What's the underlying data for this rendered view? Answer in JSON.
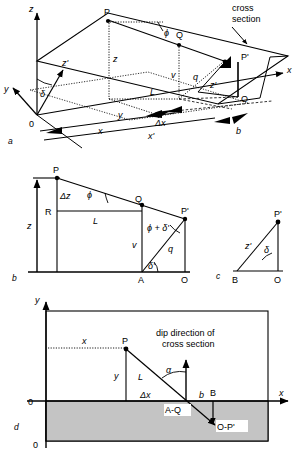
{
  "figure": {
    "panels": [
      {
        "id": "a",
        "label": "a",
        "name": "panel-a-3d-block"
      },
      {
        "id": "b",
        "label": "b",
        "name": "panel-b-vertical-section"
      },
      {
        "id": "c",
        "label": "c",
        "name": "panel-c-small-triangle"
      },
      {
        "id": "d",
        "label": "d",
        "name": "panel-d-map-view"
      }
    ]
  },
  "panel_a": {
    "annotation": "cross\nsection",
    "annotation_line1": "cross",
    "annotation_line2": "section",
    "axes": {
      "x": "x",
      "y": "y",
      "z": "z",
      "z_prime": "z'"
    },
    "points": {
      "origin": "0",
      "P": "P",
      "Q": "Q",
      "P_prime": "P'",
      "O": "O"
    },
    "lengths": {
      "z": "z",
      "v": "v",
      "q": "q",
      "L": "L",
      "z_prime": "z'",
      "y": "y",
      "x": "x",
      "x_prime": "x'",
      "delta_x": "Δx",
      "b": "b"
    },
    "angles": {
      "phi": "ϕ",
      "delta": "δ"
    }
  },
  "panel_b": {
    "points": {
      "P": "P",
      "R": "R",
      "Q": "Q",
      "P_prime": "P'",
      "A": "A",
      "O": "O"
    },
    "lengths": {
      "z": "z",
      "delta_z": "Δz",
      "L": "L",
      "v": "v",
      "q": "q"
    },
    "angles": {
      "phi": "ϕ",
      "phi_plus_delta_prime": "ϕ + δ'",
      "delta_prime": "δ'"
    }
  },
  "panel_c": {
    "points": {
      "P_prime": "P'",
      "B": "B",
      "O": "O"
    },
    "lengths": {
      "z_prime": "z'"
    },
    "angles": {
      "delta": "δ"
    }
  },
  "panel_d": {
    "axes": {
      "x": "x",
      "y": "y"
    },
    "origin_labels": {
      "top": "0",
      "bottom": "0"
    },
    "annotation_line1": "dip direction of",
    "annotation_line2": "cross section",
    "points": {
      "P": "P",
      "B": "B",
      "A_Q": "A-Q",
      "O_P_prime": "O-P'"
    },
    "lengths": {
      "x": "x",
      "y": "y",
      "L": "L",
      "delta_x": "Δx",
      "b": "b"
    },
    "angles": {
      "alpha": "α"
    }
  },
  "colors": {
    "stroke": "#000000",
    "shaded_region": "#c4c4c4",
    "background": "#ffffff"
  }
}
